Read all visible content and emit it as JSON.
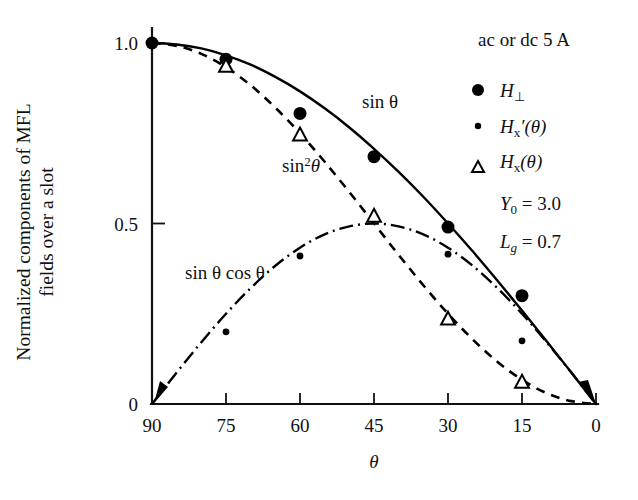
{
  "chart_data": {
    "type": "line",
    "title": "",
    "xlabel": "θ",
    "ylabel_line1": "Normalized components of MFL",
    "ylabel_line2": "fields over a slot",
    "xticks": [
      "90",
      "75",
      "60",
      "45",
      "30",
      "15",
      "0"
    ],
    "xtick_values": [
      90,
      75,
      60,
      45,
      30,
      15,
      0
    ],
    "yticks": [
      "1.0",
      "0.5",
      "0"
    ],
    "ytick_values": [
      1.0,
      0.5,
      0
    ],
    "xlim": [
      90,
      0
    ],
    "ylim": [
      0,
      1.0
    ],
    "grid": false,
    "legend_position": "top-right",
    "curve_labels": {
      "sin": "sin θ",
      "sin2": "sin",
      "sin2_sup": "2",
      "sin2_theta": "θ",
      "sincos": "sin θ cos θ"
    },
    "series": [
      {
        "name": "sin θ",
        "line": "solid",
        "x": [
          90,
          85,
          80,
          75,
          70,
          65,
          60,
          55,
          50,
          45,
          40,
          35,
          30,
          25,
          20,
          15,
          10,
          5,
          0
        ],
        "values": [
          1.0,
          0.996,
          0.985,
          0.966,
          0.94,
          0.906,
          0.866,
          0.819,
          0.766,
          0.707,
          0.643,
          0.574,
          0.5,
          0.423,
          0.342,
          0.259,
          0.174,
          0.087,
          0.0
        ]
      },
      {
        "name": "sin² θ",
        "line": "dashed",
        "x": [
          90,
          85,
          80,
          75,
          70,
          65,
          60,
          55,
          50,
          45,
          40,
          35,
          30,
          25,
          20,
          15,
          10,
          5,
          0
        ],
        "values": [
          1.0,
          0.992,
          0.97,
          0.933,
          0.883,
          0.821,
          0.75,
          0.671,
          0.587,
          0.5,
          0.413,
          0.329,
          0.25,
          0.179,
          0.117,
          0.067,
          0.03,
          0.008,
          0.0
        ]
      },
      {
        "name": "sin θ cos θ",
        "line": "dash-dot",
        "x": [
          90,
          85,
          80,
          75,
          70,
          65,
          60,
          55,
          50,
          45,
          40,
          35,
          30,
          25,
          20,
          15,
          10,
          5,
          0
        ],
        "values": [
          0.0,
          0.087,
          0.171,
          0.25,
          0.321,
          0.383,
          0.433,
          0.47,
          0.492,
          0.5,
          0.492,
          0.47,
          0.433,
          0.383,
          0.321,
          0.25,
          0.171,
          0.087,
          0.0
        ]
      }
    ],
    "points": [
      {
        "marker": "filled-circle",
        "series": "H_perp",
        "x": [
          90,
          75,
          60,
          45,
          30,
          15
        ],
        "values": [
          1.0,
          0.955,
          0.805,
          0.685,
          0.49,
          0.3
        ]
      },
      {
        "marker": "small-dot",
        "series": "Hx_prime",
        "x": [
          75,
          60,
          45,
          30,
          15
        ],
        "values": [
          0.2,
          0.41,
          0.515,
          0.415,
          0.175
        ]
      },
      {
        "marker": "open-triangle",
        "series": "Hx",
        "x": [
          75,
          60,
          45,
          30,
          15
        ],
        "values": [
          0.935,
          0.745,
          0.52,
          0.235,
          0.06
        ]
      }
    ],
    "annotations": {
      "condition": "ac or dc 5 A",
      "params": [
        {
          "symbol": "Y",
          "sub": "0",
          "eq": "= 3.0"
        },
        {
          "symbol": "L",
          "sub": "g",
          "eq": "= 0.7"
        }
      ]
    },
    "legend": [
      {
        "marker": "filled-circle",
        "symbol": "H",
        "sub": "⊥",
        "suffix": ""
      },
      {
        "marker": "small-dot",
        "symbol": "H",
        "sub": "x",
        "suffix": "′(θ)"
      },
      {
        "marker": "open-triangle",
        "symbol": "H",
        "sub": "x",
        "suffix": "(θ)"
      }
    ],
    "colors": {
      "line": "#000000",
      "text": "#111111",
      "background": "#ffffff"
    }
  }
}
